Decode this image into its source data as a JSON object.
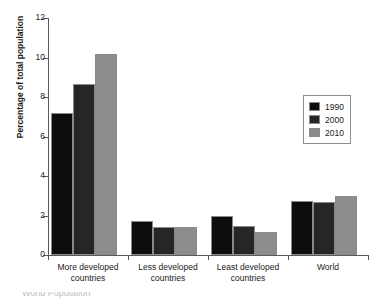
{
  "figure": {
    "title_partial": "",
    "caption_partial": "World Population",
    "ylabel": "Percentage of total population"
  },
  "axes": {
    "yticks": [
      "0",
      "2",
      "4",
      "6",
      "8",
      "10",
      "12"
    ],
    "ymin": 0,
    "ymax": 12
  },
  "legend": {
    "entries": [
      {
        "label": "1990",
        "color": "#0d0d0d"
      },
      {
        "label": "2000",
        "color": "#262626"
      },
      {
        "label": "2010",
        "color": "#8c8c8c"
      }
    ]
  },
  "categories": [
    {
      "line1": "More developed",
      "line2": "countries"
    },
    {
      "line1": "Less developed",
      "line2": "countries"
    },
    {
      "line1": "Least developed",
      "line2": "countries"
    },
    {
      "line1": "World",
      "line2": ""
    }
  ],
  "chart_data": {
    "type": "bar",
    "title": "",
    "xlabel": "",
    "ylabel": "Percentage of total population",
    "ylim": [
      0,
      12
    ],
    "yticks": [
      0,
      2,
      4,
      6,
      8,
      10,
      12
    ],
    "grid": false,
    "legend_position": "right",
    "categories": [
      "More developed countries",
      "Less developed countries",
      "Least developed countries",
      "World"
    ],
    "series": [
      {
        "name": "1990",
        "color": "#0d0d0d",
        "values": [
          7.2,
          1.7,
          2.0,
          2.75
        ]
      },
      {
        "name": "2000",
        "color": "#262626",
        "values": [
          8.65,
          1.42,
          1.45,
          2.7
        ]
      },
      {
        "name": "2010",
        "color": "#8c8c8c",
        "values": [
          10.2,
          1.42,
          1.15,
          3.0
        ]
      }
    ]
  }
}
